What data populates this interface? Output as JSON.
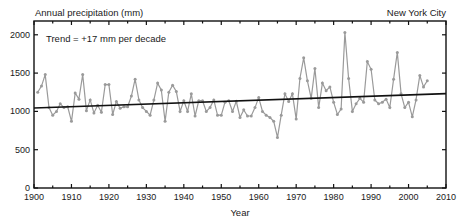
{
  "header": {
    "ylabel_title": "Annual precipitation (mm)",
    "location": "New York City",
    "annotation": "Trend = +17 mm per decade"
  },
  "axes": {
    "xlabel": "Year",
    "x_ticks": [
      "1900",
      "1910",
      "1920",
      "1930",
      "1940",
      "1950",
      "1960",
      "1970",
      "1980",
      "1990",
      "2000",
      "2010"
    ],
    "y_ticks": [
      "0",
      "500",
      "1000",
      "1500",
      "2000"
    ]
  },
  "colors": {
    "series": "#9a9a9a",
    "trend": "#111111",
    "axis": "#111111"
  },
  "chart_data": {
    "type": "line",
    "xlabel": "Year",
    "ylabel": "Annual precipitation (mm)",
    "xlim": [
      1900,
      2010
    ],
    "ylim": [
      0,
      2200
    ],
    "x_ticks": [
      1900,
      1910,
      1920,
      1930,
      1940,
      1950,
      1960,
      1970,
      1980,
      1990,
      2000,
      2010
    ],
    "y_ticks": [
      0,
      500,
      1000,
      1500,
      2000
    ],
    "grid": false,
    "legend": null,
    "annotations": [
      "Trend = +17 mm per decade",
      "New York City"
    ],
    "series": [
      {
        "name": "Annual precipitation",
        "x": [
          1901,
          1902,
          1903,
          1904,
          1905,
          1906,
          1907,
          1908,
          1909,
          1910,
          1911,
          1912,
          1913,
          1914,
          1915,
          1916,
          1917,
          1918,
          1919,
          1920,
          1921,
          1922,
          1923,
          1924,
          1925,
          1926,
          1927,
          1928,
          1929,
          1930,
          1931,
          1932,
          1933,
          1934,
          1935,
          1936,
          1937,
          1938,
          1939,
          1940,
          1941,
          1942,
          1943,
          1944,
          1945,
          1946,
          1947,
          1948,
          1949,
          1950,
          1951,
          1952,
          1953,
          1954,
          1955,
          1956,
          1957,
          1958,
          1959,
          1960,
          1961,
          1962,
          1963,
          1964,
          1965,
          1966,
          1967,
          1968,
          1969,
          1970,
          1971,
          1972,
          1973,
          1974,
          1975,
          1976,
          1977,
          1978,
          1979,
          1980,
          1981,
          1982,
          1983,
          1984,
          1985,
          1986,
          1987,
          1988,
          1989,
          1990,
          1991,
          1992,
          1993,
          1994,
          1995,
          1996,
          1997,
          1998,
          1999,
          2000,
          2001,
          2002,
          2003,
          2004,
          2005
        ],
        "values": [
          1250,
          1330,
          1480,
          1050,
          950,
          1000,
          1100,
          1050,
          1060,
          870,
          1240,
          1160,
          1480,
          1010,
          1150,
          980,
          1080,
          990,
          1350,
          1350,
          960,
          1130,
          1040,
          1060,
          1060,
          1200,
          1420,
          1150,
          1050,
          1000,
          950,
          1150,
          1370,
          1280,
          870,
          1250,
          1340,
          1260,
          1000,
          1140,
          1000,
          1230,
          940,
          1140,
          1140,
          1000,
          1050,
          1150,
          950,
          950,
          1120,
          1140,
          1000,
          1130,
          920,
          1020,
          940,
          940,
          1050,
          1180,
          1000,
          950,
          920,
          870,
          660,
          950,
          1230,
          1130,
          1230,
          900,
          1430,
          1700,
          1400,
          1170,
          1560,
          1050,
          1370,
          1270,
          1320,
          1120,
          960,
          1030,
          2030,
          1430,
          1000,
          1100,
          1170,
          1120,
          1650,
          1550,
          1150,
          1100,
          1120,
          1160,
          1050,
          1420,
          1770,
          1230,
          1050,
          1120,
          930,
          1150,
          1470,
          1320,
          1400
        ]
      },
      {
        "name": "Linear trend",
        "x": [
          1900,
          2010
        ],
        "values": [
          1045,
          1232
        ]
      }
    ]
  }
}
